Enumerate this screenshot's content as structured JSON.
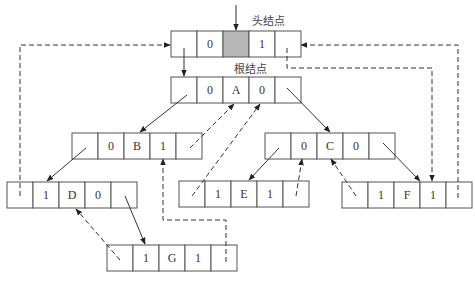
{
  "labels": {
    "head": "头结点",
    "root": "根结点"
  },
  "nodes": [
    {
      "id": "head",
      "x": 171,
      "y": 31,
      "cells": [
        "",
        "0",
        "",
        "1",
        ""
      ],
      "shaded_cell": 2
    },
    {
      "id": "A",
      "x": 171,
      "y": 77,
      "cells": [
        "",
        "0",
        "A",
        "0",
        ""
      ]
    },
    {
      "id": "B",
      "x": 72,
      "y": 133,
      "cells": [
        "",
        "0",
        "B",
        "1",
        ""
      ]
    },
    {
      "id": "C",
      "x": 265,
      "y": 133,
      "cells": [
        "",
        "0",
        "C",
        "0",
        ""
      ]
    },
    {
      "id": "D",
      "x": 7,
      "y": 182,
      "cells": [
        "",
        "1",
        "D",
        "0",
        ""
      ]
    },
    {
      "id": "E",
      "x": 179,
      "y": 181,
      "cells": [
        "",
        "1",
        "E",
        "1",
        ""
      ]
    },
    {
      "id": "F",
      "x": 342,
      "y": 182,
      "cells": [
        "",
        "1",
        "F",
        "1",
        ""
      ]
    },
    {
      "id": "G",
      "x": 107,
      "y": 245,
      "cells": [
        "",
        "1",
        "G",
        "1",
        ""
      ]
    }
  ],
  "colors": {
    "line": "#333333",
    "shaded": "#b8b8b8",
    "background": "#ffffff"
  }
}
